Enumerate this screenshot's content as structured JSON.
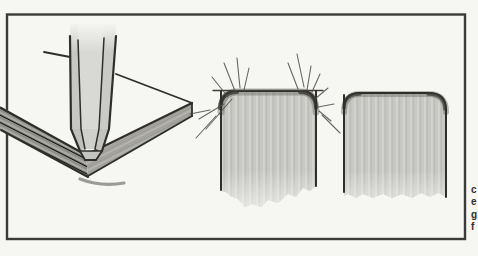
{
  "figure": {
    "kind": "hand-drawn-marker-rendering-illustration",
    "panels": [
      {
        "name": "square-post-on-board-corner"
      },
      {
        "name": "rounded-corner-marker-practice-with-guide-strokes"
      },
      {
        "name": "rounded-corner-marker-finished"
      }
    ]
  },
  "caption": {
    "fragments": [
      "c",
      "e",
      "g",
      "f"
    ]
  },
  "colors": {
    "paper": "#f6f6f3",
    "frame": "#3b3b39",
    "ink": "#2e2e2b",
    "marker_fill_light": "#cbcbc7",
    "marker_fill_column": "#d8d8d4",
    "marker_board_dark": "#9d9d97",
    "marker_top_band": "#76766f",
    "corner_pool_dark": "#38382f"
  }
}
